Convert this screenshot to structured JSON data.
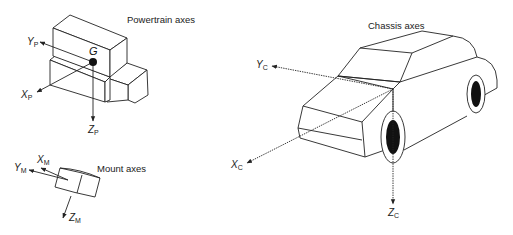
{
  "diagram": {
    "powertrain": {
      "caption": "Powertrain axes",
      "center_label": "G",
      "axes": [
        {
          "name": "X",
          "subscript": "P"
        },
        {
          "name": "Y",
          "subscript": "P"
        },
        {
          "name": "Z",
          "subscript": "P"
        }
      ]
    },
    "mount": {
      "caption": "Mount axes",
      "axes": [
        {
          "name": "X",
          "subscript": "M"
        },
        {
          "name": "Y",
          "subscript": "M"
        },
        {
          "name": "Z",
          "subscript": "M"
        }
      ]
    },
    "chassis": {
      "caption": "Chassis axes",
      "axes": [
        {
          "name": "X",
          "subscript": "C"
        },
        {
          "name": "Y",
          "subscript": "C"
        },
        {
          "name": "Z",
          "subscript": "C"
        }
      ]
    },
    "colors": {
      "line": "#222222",
      "background": "#ffffff",
      "wheel_fill": "#111111"
    }
  }
}
